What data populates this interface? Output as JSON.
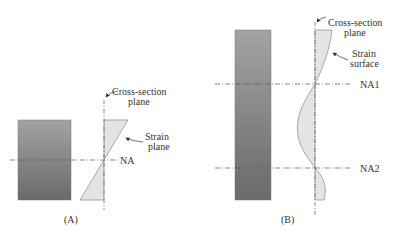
{
  "panel_a": {
    "caption": "(A)",
    "cross_section_label_1": "Cross-section",
    "cross_section_label_2": "plane",
    "strain_label_1": "Strain",
    "strain_label_2": "plane",
    "neutral_axis": "NA"
  },
  "panel_b": {
    "caption": "(B)",
    "cross_section_label_1": "Cross-section",
    "cross_section_label_2": "plane",
    "strain_label_1": "Strain",
    "strain_label_2": "surface",
    "neutral_axis_1": "NA1",
    "neutral_axis_2": "NA2"
  },
  "colors": {
    "beam_top": "#9a9a9a",
    "beam_bottom": "#6f6f6f",
    "strain_fill": "#e4e4e4",
    "line": "#555555"
  }
}
